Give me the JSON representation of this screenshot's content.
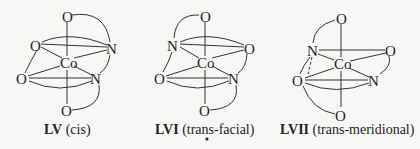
{
  "figure": {
    "structures": [
      {
        "id": "LV",
        "roman": "LV",
        "descriptor": "(cis)",
        "atoms": {
          "top": "O",
          "upper_left": "O",
          "upper_right": "N",
          "center": "Co",
          "lower_left": "O",
          "lower_right": "N",
          "bottom": "O"
        }
      },
      {
        "id": "LVI",
        "roman": "LVI",
        "descriptor": "(trans-facial)",
        "atoms": {
          "top": "O",
          "upper_left": "N",
          "upper_right": "O",
          "center": "Co",
          "lower_left": "O",
          "lower_right": "N",
          "bottom": "O"
        }
      },
      {
        "id": "LVII",
        "roman": "LVII",
        "descriptor": "(trans-meridional)",
        "atoms": {
          "top": "O",
          "upper_left": "N",
          "upper_right": "O",
          "center": "Co",
          "lower_left": "O",
          "lower_right": "N",
          "bottom": "O"
        }
      }
    ]
  }
}
